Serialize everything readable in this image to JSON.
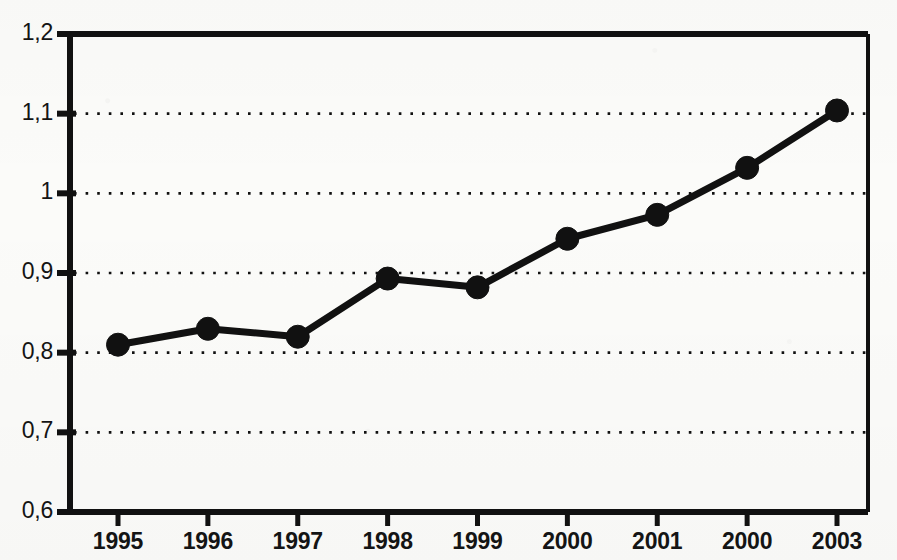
{
  "chart_data": {
    "type": "line",
    "title": "",
    "subtitle": "",
    "xlabel": "",
    "ylabel": "",
    "categories": [
      "1995",
      "1996",
      "1997",
      "1998",
      "1999",
      "2000",
      "2001",
      "2000",
      "2003"
    ],
    "values": [
      0.81,
      0.83,
      0.82,
      0.893,
      0.882,
      0.943,
      0.973,
      1.032,
      1.104
    ],
    "series": [
      {
        "name": "",
        "values": [
          0.81,
          0.83,
          0.82,
          0.893,
          0.882,
          0.943,
          0.973,
          1.032,
          1.104
        ]
      }
    ],
    "ylim": [
      0.6,
      1.2
    ],
    "y_ticks": [
      0.6,
      0.7,
      0.8,
      0.9,
      1.0,
      1.1,
      1.2
    ],
    "y_tick_labels": [
      "0,6",
      "0,7",
      "0,8",
      "0,9",
      "1",
      "1,1",
      "1,2"
    ],
    "x_tick_labels": [
      "1995",
      "1996",
      "1997",
      "1998",
      "1999",
      "2000",
      "2001",
      "2000",
      "2003"
    ],
    "grid": "horizontal-dotted",
    "legend": "none",
    "decimal_separator": ",",
    "marker": "filled-circle",
    "line_color": "#111111",
    "marker_color": "#111111",
    "background_color": "#fbfbf9",
    "axis_color": "#111111"
  },
  "axes": {
    "y_labels": [
      "1,2",
      "1,1",
      "1",
      "0,9",
      "0,8",
      "0,7",
      "0,6"
    ],
    "x_labels": [
      "1995",
      "1996",
      "1997",
      "1998",
      "1999",
      "2000",
      "2001",
      "2000",
      "2003"
    ]
  }
}
